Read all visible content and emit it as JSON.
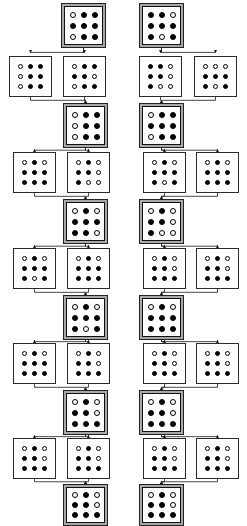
{
  "diagram": {
    "colors": {
      "background": "#ffffff",
      "node_border": "#1a1a1a",
      "highlight_frame": "#a8a8a8",
      "dot_filled": "#000000",
      "dot_open": "#ffffff",
      "edge": "#1a1a1a"
    },
    "legend": {
      "filled_dot": "filled",
      "open_dot": "open",
      "highlighted_node": "selected state",
      "plain_node": "candidate state"
    },
    "counts": {
      "levels": 11,
      "highlighted_levels": 6,
      "branch_levels": 5,
      "nodes_total": 32,
      "grid_size": "3x3"
    },
    "levels": [
      {
        "index": 0,
        "kind": "highlight",
        "nodes": [
          {
            "id": "L0-A",
            "highlight": true,
            "x": 61,
            "y": 3,
            "w": 45,
            "h": 45,
            "grid": [
              [
                0,
                1,
                1
              ],
              [
                1,
                1,
                1
              ],
              [
                0,
                1,
                1
              ]
            ]
          },
          {
            "id": "L0-B",
            "highlight": true,
            "x": 139,
            "y": 3,
            "w": 45,
            "h": 45,
            "grid": [
              [
                1,
                1,
                0
              ],
              [
                1,
                1,
                1
              ],
              [
                1,
                0,
                1
              ]
            ]
          }
        ]
      },
      {
        "index": 1,
        "kind": "branch",
        "nodes": [
          {
            "id": "L1-A",
            "highlight": false,
            "x": 9,
            "y": 56,
            "w": 43,
            "h": 41,
            "grid": [
              [
                0,
                1,
                1
              ],
              [
                0,
                1,
                1
              ],
              [
                0,
                1,
                1
              ]
            ]
          },
          {
            "id": "L1-B",
            "highlight": false,
            "x": 63,
            "y": 56,
            "w": 43,
            "h": 41,
            "grid": [
              [
                0,
                1,
                1
              ],
              [
                1,
                1,
                0
              ],
              [
                0,
                1,
                1
              ]
            ]
          },
          {
            "id": "L1-C",
            "highlight": false,
            "x": 139,
            "y": 56,
            "w": 43,
            "h": 41,
            "grid": [
              [
                1,
                1,
                0
              ],
              [
                1,
                1,
                0
              ],
              [
                1,
                0,
                0
              ]
            ]
          },
          {
            "id": "L1-D",
            "highlight": false,
            "x": 194,
            "y": 56,
            "w": 43,
            "h": 41,
            "grid": [
              [
                0,
                0,
                0
              ],
              [
                1,
                1,
                1
              ],
              [
                1,
                0,
                1
              ]
            ]
          }
        ]
      },
      {
        "index": 2,
        "kind": "highlight",
        "nodes": [
          {
            "id": "L2-A",
            "highlight": true,
            "x": 63,
            "y": 103,
            "w": 45,
            "h": 45,
            "grid": [
              [
                0,
                1,
                1
              ],
              [
                0,
                1,
                1
              ],
              [
                0,
                1,
                1
              ]
            ]
          },
          {
            "id": "L2-B",
            "highlight": true,
            "x": 139,
            "y": 103,
            "w": 45,
            "h": 45,
            "grid": [
              [
                0,
                1,
                1
              ],
              [
                1,
                1,
                1
              ],
              [
                0,
                1,
                1
              ]
            ]
          }
        ]
      },
      {
        "index": 3,
        "kind": "branch",
        "nodes": [
          {
            "id": "L3-A",
            "highlight": false,
            "x": 13,
            "y": 152,
            "w": 43,
            "h": 41,
            "grid": [
              [
                0,
                1,
                0
              ],
              [
                1,
                1,
                1
              ],
              [
                1,
                1,
                1
              ]
            ]
          },
          {
            "id": "L3-B",
            "highlight": false,
            "x": 67,
            "y": 152,
            "w": 43,
            "h": 41,
            "grid": [
              [
                0,
                1,
                0
              ],
              [
                1,
                1,
                0
              ],
              [
                1,
                0,
                0
              ]
            ]
          },
          {
            "id": "L3-C",
            "highlight": false,
            "x": 143,
            "y": 152,
            "w": 43,
            "h": 41,
            "grid": [
              [
                0,
                1,
                0
              ],
              [
                1,
                1,
                1
              ],
              [
                1,
                0,
                1
              ]
            ]
          },
          {
            "id": "L3-D",
            "highlight": false,
            "x": 196,
            "y": 152,
            "w": 43,
            "h": 41,
            "grid": [
              [
                0,
                1,
                0
              ],
              [
                1,
                1,
                1
              ],
              [
                1,
                1,
                1
              ]
            ]
          }
        ]
      },
      {
        "index": 4,
        "kind": "highlight",
        "nodes": [
          {
            "id": "L4-A",
            "highlight": true,
            "x": 63,
            "y": 199,
            "w": 45,
            "h": 45,
            "grid": [
              [
                0,
                1,
                0
              ],
              [
                1,
                1,
                1
              ],
              [
                1,
                1,
                0
              ]
            ]
          },
          {
            "id": "L4-B",
            "highlight": true,
            "x": 139,
            "y": 199,
            "w": 45,
            "h": 45,
            "grid": [
              [
                0,
                1,
                0
              ],
              [
                1,
                1,
                0
              ],
              [
                1,
                0,
                0
              ]
            ]
          }
        ]
      },
      {
        "index": 5,
        "kind": "branch",
        "nodes": [
          {
            "id": "L5-A",
            "highlight": false,
            "x": 13,
            "y": 248,
            "w": 43,
            "h": 41,
            "grid": [
              [
                0,
                1,
                0
              ],
              [
                1,
                1,
                1
              ],
              [
                1,
                0,
                1
              ]
            ]
          },
          {
            "id": "L5-B",
            "highlight": false,
            "x": 67,
            "y": 248,
            "w": 43,
            "h": 41,
            "grid": [
              [
                0,
                1,
                0
              ],
              [
                1,
                1,
                1
              ],
              [
                1,
                1,
                1
              ]
            ]
          },
          {
            "id": "L5-C",
            "highlight": false,
            "x": 143,
            "y": 248,
            "w": 43,
            "h": 41,
            "grid": [
              [
                0,
                1,
                0
              ],
              [
                1,
                1,
                0
              ],
              [
                1,
                1,
                1
              ]
            ]
          },
          {
            "id": "L5-D",
            "highlight": false,
            "x": 196,
            "y": 248,
            "w": 43,
            "h": 41,
            "grid": [
              [
                0,
                1,
                0
              ],
              [
                1,
                1,
                0
              ],
              [
                1,
                1,
                1
              ]
            ]
          }
        ]
      },
      {
        "index": 6,
        "kind": "highlight",
        "nodes": [
          {
            "id": "L6-A",
            "highlight": true,
            "x": 63,
            "y": 295,
            "w": 45,
            "h": 45,
            "grid": [
              [
                0,
                1,
                0
              ],
              [
                1,
                1,
                1
              ],
              [
                1,
                0,
                1
              ]
            ]
          },
          {
            "id": "L6-B",
            "highlight": true,
            "x": 139,
            "y": 295,
            "w": 45,
            "h": 45,
            "grid": [
              [
                0,
                1,
                0
              ],
              [
                1,
                1,
                1
              ],
              [
                1,
                1,
                1
              ]
            ]
          }
        ]
      },
      {
        "index": 7,
        "kind": "branch",
        "nodes": [
          {
            "id": "L7-A",
            "highlight": false,
            "x": 13,
            "y": 343,
            "w": 43,
            "h": 41,
            "grid": [
              [
                0,
                1,
                0
              ],
              [
                1,
                1,
                1
              ],
              [
                1,
                1,
                1
              ]
            ]
          },
          {
            "id": "L7-B",
            "highlight": false,
            "x": 67,
            "y": 343,
            "w": 43,
            "h": 41,
            "grid": [
              [
                0,
                1,
                0
              ],
              [
                1,
                1,
                0
              ],
              [
                1,
                1,
                1
              ]
            ]
          },
          {
            "id": "L7-C",
            "highlight": false,
            "x": 143,
            "y": 343,
            "w": 43,
            "h": 41,
            "grid": [
              [
                0,
                1,
                0
              ],
              [
                1,
                1,
                0
              ],
              [
                1,
                1,
                1
              ]
            ]
          },
          {
            "id": "L7-D",
            "highlight": false,
            "x": 196,
            "y": 343,
            "w": 43,
            "h": 41,
            "grid": [
              [
                0,
                1,
                0
              ],
              [
                1,
                1,
                0
              ],
              [
                1,
                1,
                1
              ]
            ]
          }
        ]
      },
      {
        "index": 8,
        "kind": "highlight",
        "nodes": [
          {
            "id": "L8-A",
            "highlight": true,
            "x": 63,
            "y": 390,
            "w": 45,
            "h": 45,
            "grid": [
              [
                0,
                1,
                0
              ],
              [
                1,
                1,
                0
              ],
              [
                1,
                1,
                1
              ]
            ]
          },
          {
            "id": "L8-B",
            "highlight": true,
            "x": 139,
            "y": 390,
            "w": 45,
            "h": 45,
            "grid": [
              [
                0,
                1,
                0
              ],
              [
                1,
                1,
                0
              ],
              [
                1,
                1,
                1
              ]
            ]
          }
        ]
      },
      {
        "index": 9,
        "kind": "branch",
        "nodes": [
          {
            "id": "L9-A",
            "highlight": false,
            "x": 13,
            "y": 438,
            "w": 43,
            "h": 41,
            "grid": [
              [
                0,
                1,
                0
              ],
              [
                1,
                1,
                0
              ],
              [
                1,
                1,
                1
              ]
            ]
          },
          {
            "id": "L9-B",
            "highlight": false,
            "x": 67,
            "y": 438,
            "w": 43,
            "h": 41,
            "grid": [
              [
                0,
                1,
                0
              ],
              [
                1,
                1,
                0
              ],
              [
                1,
                1,
                1
              ]
            ]
          },
          {
            "id": "L9-C",
            "highlight": false,
            "x": 143,
            "y": 438,
            "w": 43,
            "h": 41,
            "grid": [
              [
                0,
                1,
                0
              ],
              [
                1,
                1,
                0
              ],
              [
                1,
                1,
                1
              ]
            ]
          },
          {
            "id": "L9-D",
            "highlight": false,
            "x": 196,
            "y": 438,
            "w": 43,
            "h": 41,
            "grid": [
              [
                0,
                1,
                0
              ],
              [
                1,
                1,
                0
              ],
              [
                1,
                1,
                1
              ]
            ]
          }
        ]
      },
      {
        "index": 10,
        "kind": "highlight",
        "nodes": [
          {
            "id": "L10-A",
            "highlight": true,
            "x": 63,
            "y": 484,
            "w": 45,
            "h": 42,
            "grid": [
              [
                0,
                1,
                0
              ],
              [
                1,
                1,
                0
              ],
              [
                1,
                1,
                1
              ]
            ]
          },
          {
            "id": "L10-B",
            "highlight": true,
            "x": 139,
            "y": 484,
            "w": 45,
            "h": 42,
            "grid": [
              [
                0,
                1,
                0
              ],
              [
                1,
                1,
                0
              ],
              [
                1,
                1,
                1
              ]
            ]
          }
        ]
      }
    ],
    "edges": [
      {
        "from": "L0-A",
        "to": "L1-A"
      },
      {
        "from": "L0-A",
        "to": "L1-B"
      },
      {
        "from": "L0-B",
        "to": "L1-C"
      },
      {
        "from": "L0-B",
        "to": "L1-D"
      },
      {
        "from": "L1-A",
        "to": "L2-A"
      },
      {
        "from": "L1-B",
        "to": "L2-A"
      },
      {
        "from": "L1-C",
        "to": "L2-B"
      },
      {
        "from": "L1-D",
        "to": "L2-B"
      },
      {
        "from": "L2-A",
        "to": "L3-A"
      },
      {
        "from": "L2-A",
        "to": "L3-B"
      },
      {
        "from": "L2-B",
        "to": "L3-C"
      },
      {
        "from": "L2-B",
        "to": "L3-D"
      },
      {
        "from": "L3-A",
        "to": "L4-A"
      },
      {
        "from": "L3-B",
        "to": "L4-A"
      },
      {
        "from": "L3-C",
        "to": "L4-B"
      },
      {
        "from": "L3-D",
        "to": "L4-B"
      },
      {
        "from": "L4-A",
        "to": "L5-A"
      },
      {
        "from": "L4-A",
        "to": "L5-B"
      },
      {
        "from": "L4-B",
        "to": "L5-C"
      },
      {
        "from": "L4-B",
        "to": "L5-D"
      },
      {
        "from": "L5-A",
        "to": "L6-A"
      },
      {
        "from": "L5-B",
        "to": "L6-A"
      },
      {
        "from": "L5-C",
        "to": "L6-B"
      },
      {
        "from": "L5-D",
        "to": "L6-B"
      },
      {
        "from": "L6-A",
        "to": "L7-A"
      },
      {
        "from": "L6-A",
        "to": "L7-B"
      },
      {
        "from": "L6-B",
        "to": "L7-C"
      },
      {
        "from": "L6-B",
        "to": "L7-D"
      },
      {
        "from": "L7-A",
        "to": "L8-A"
      },
      {
        "from": "L7-B",
        "to": "L8-A"
      },
      {
        "from": "L7-C",
        "to": "L8-B"
      },
      {
        "from": "L7-D",
        "to": "L8-B"
      },
      {
        "from": "L8-A",
        "to": "L9-A"
      },
      {
        "from": "L8-A",
        "to": "L9-B"
      },
      {
        "from": "L8-B",
        "to": "L9-C"
      },
      {
        "from": "L8-B",
        "to": "L9-D"
      },
      {
        "from": "L9-A",
        "to": "L10-A"
      },
      {
        "from": "L9-B",
        "to": "L10-A"
      },
      {
        "from": "L9-C",
        "to": "L10-B"
      },
      {
        "from": "L9-D",
        "to": "L10-B"
      }
    ]
  }
}
